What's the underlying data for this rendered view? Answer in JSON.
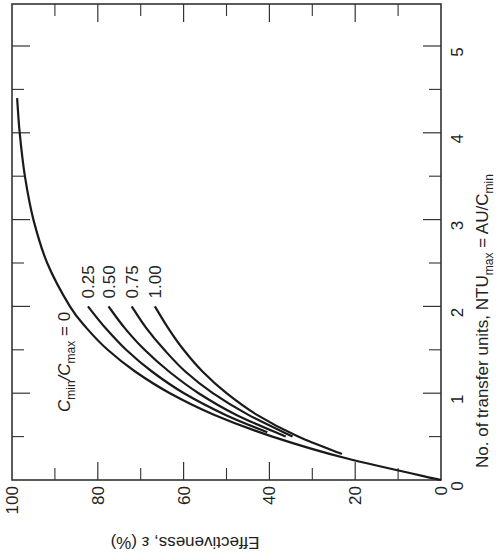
{
  "chart_data": {
    "type": "line",
    "title": "",
    "orientation": "rotated 90° clockwise (printed sideways)",
    "xlabel": "No. of transfer units, NTU_max = AU/C_min",
    "xlabel_parts": {
      "main": "No. of transfer units, NTU",
      "sub1": "max",
      "mid": " = AU/C",
      "sub2": "min"
    },
    "ylabel": "Effectiveness, ε (%)",
    "xlim": [
      0,
      5.5
    ],
    "ylim": [
      0,
      100
    ],
    "x_ticks": [
      0,
      1,
      2,
      3,
      4,
      5
    ],
    "x_minor_ticks": [
      0.5,
      1.5,
      2.5,
      3.5,
      4.5
    ],
    "y_ticks": [
      0,
      20,
      40,
      60,
      80,
      100
    ],
    "y_minor_ticks": [
      10,
      30,
      50,
      70,
      90
    ],
    "grid": false,
    "legend": "inline curve labels",
    "series": [
      {
        "name": "C_min/C_max = 0",
        "label": "0",
        "x": [
          0,
          0.25,
          0.5,
          0.75,
          1.0,
          1.25,
          1.5,
          1.75,
          2.0,
          2.5,
          3.0,
          3.5,
          4.0,
          4.4
        ],
        "y": [
          0,
          22.1,
          39.3,
          52.8,
          63.2,
          71.3,
          77.7,
          82.6,
          86.5,
          91.8,
          95.0,
          97.0,
          98.2,
          98.8
        ]
      },
      {
        "name": "C_min/C_max = 0.25",
        "label": "0.25",
        "x": [
          0.55,
          0.75,
          1.0,
          1.25,
          1.5,
          1.75,
          2.0
        ],
        "y": [
          40.5,
          50.2,
          59.9,
          67.4,
          73.4,
          78.2,
          82.3
        ]
      },
      {
        "name": "C_min/C_max = 0.50",
        "label": "0.50",
        "x": [
          0.5,
          0.75,
          1.0,
          1.25,
          1.5,
          1.75,
          2.0
        ],
        "y": [
          36.2,
          47.7,
          56.5,
          63.4,
          69.1,
          73.7,
          77.5
        ]
      },
      {
        "name": "C_min/C_max = 0.75",
        "label": "0.75",
        "x": [
          0.5,
          0.75,
          1.0,
          1.25,
          1.5,
          1.75,
          2.0
        ],
        "y": [
          34.6,
          44.9,
          53.2,
          59.6,
          64.5,
          68.7,
          72.1
        ]
      },
      {
        "name": "C_min/C_max = 1.00",
        "label": "1.00",
        "x": [
          0.3,
          0.5,
          0.75,
          1.0,
          1.25,
          1.5,
          1.75,
          2.0
        ],
        "y": [
          23.1,
          33.3,
          42.9,
          50.0,
          55.6,
          60.0,
          63.6,
          66.7
        ]
      }
    ],
    "annotations": [
      {
        "text": "C_min/C_max = 0",
        "parts": {
          "c1": "C",
          "sub1": "min",
          "slash": "/C",
          "sub2": "max",
          "eq": " = 0"
        }
      }
    ]
  },
  "labels": {
    "x_tick_labels": [
      "0",
      "1",
      "2",
      "3",
      "4",
      "5"
    ],
    "y_tick_labels": [
      "0",
      "20",
      "40",
      "60",
      "80",
      "100"
    ],
    "y_axis_title": "Effectiveness, ε (%)",
    "x_axis_title_main": "No. of transfer units, NTU",
    "x_axis_title_sub1": "max",
    "x_axis_title_mid": " = AU/C",
    "x_axis_title_sub2": "min",
    "curve_labels": [
      "0.25",
      "0.50",
      "0.75",
      "1.00"
    ],
    "c0_label_c": "C",
    "c0_label_sub1": "min",
    "c0_label_mid": "/C",
    "c0_label_sub2": "max",
    "c0_label_eq": " = 0"
  }
}
